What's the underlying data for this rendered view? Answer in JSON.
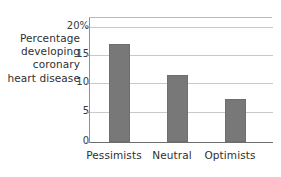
{
  "chart_data": {
    "type": "bar",
    "title": "",
    "subtitle": "",
    "categories": [
      "Pessimists",
      "Neutral",
      "Optimists"
    ],
    "values": [
      17.2,
      11.7,
      7.6
    ],
    "xlabel": "",
    "ylabel": "Percentage developing coronary heart disease",
    "ylabel_lines": [
      "Percentage",
      "developing",
      "coronary",
      "heart disease"
    ],
    "ylim": [
      0,
      20
    ],
    "ytick_labels": [
      "20%",
      "15",
      "10",
      "5",
      "0"
    ],
    "ytick_values": [
      20,
      15,
      10,
      5,
      0
    ],
    "grid": true,
    "grid_axis": "y",
    "legend": false,
    "legend_position": "none",
    "bar_color": "#787878",
    "grid_color": "#c9c9c9",
    "axis_color": "#6d6d6d",
    "background_color": "#ffffff",
    "text_color": "#2f2f2f"
  }
}
